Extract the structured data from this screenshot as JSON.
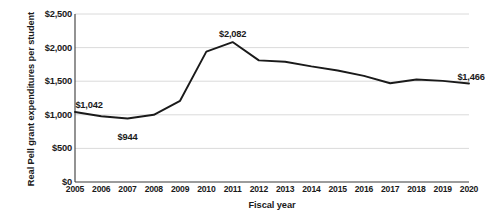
{
  "chart_data": {
    "type": "line",
    "title": "",
    "xlabel": "Fiscal year",
    "ylabel": "Real Pell grant expenditures per student",
    "categories": [
      "2005",
      "2006",
      "2007",
      "2008",
      "2009",
      "2010",
      "2011",
      "2012",
      "2013",
      "2014",
      "2015",
      "2016",
      "2017",
      "2018",
      "2019",
      "2020"
    ],
    "values": [
      1042,
      978,
      944,
      1000,
      1208,
      1940,
      2082,
      1810,
      1790,
      1720,
      1660,
      1580,
      1470,
      1525,
      1505,
      1466
    ],
    "series": [
      {
        "name": "Real Pell grant expenditures per student",
        "values": [
          1042,
          978,
          944,
          1000,
          1208,
          1940,
          2082,
          1810,
          1790,
          1720,
          1660,
          1580,
          1470,
          1525,
          1505,
          1466
        ]
      }
    ],
    "ylim": [
      0,
      2500
    ],
    "ytick_values": [
      0,
      500,
      1000,
      1500,
      2000,
      2500
    ],
    "ytick_labels": [
      "$0",
      "$500",
      "$1,000",
      "$1,500",
      "$2,000",
      "$2,500"
    ],
    "grid": true,
    "grid_axis": "y",
    "legend": false,
    "legend_position": "none",
    "line_color": "#1a1a1a",
    "grid_color": "#d6d6d6",
    "axis_color": "#3a3a3a",
    "background_color": "#ffffff",
    "annotations": [
      {
        "category": "2005",
        "value": 1042,
        "text": "$1,042",
        "position": "above-left"
      },
      {
        "category": "2007",
        "value": 944,
        "text": "$944",
        "position": "below"
      },
      {
        "category": "2011",
        "value": 2082,
        "text": "$2,082",
        "position": "above"
      },
      {
        "category": "2020",
        "value": 1466,
        "text": "$1,466",
        "position": "above-right"
      }
    ]
  },
  "bleed_text": {
    "line1": "paper show-through",
    "line2": "paper show-through"
  }
}
